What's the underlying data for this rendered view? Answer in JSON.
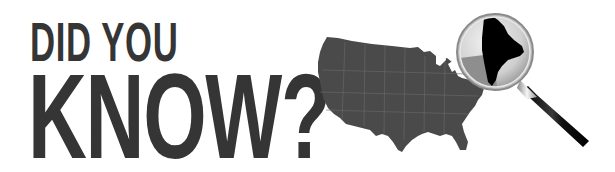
{
  "headline": {
    "line1": "DID YOU",
    "line2": "KNOW?"
  },
  "illustration": {
    "map_label": "United States map",
    "highlighted_state": "Maine",
    "magnifier": "magnifying glass over Maine",
    "colors": {
      "text": "#353535",
      "map_fill": "#4a4a4a",
      "state_fill": "#000000",
      "lens": "#d8d8d8",
      "handle": "#111111"
    }
  }
}
